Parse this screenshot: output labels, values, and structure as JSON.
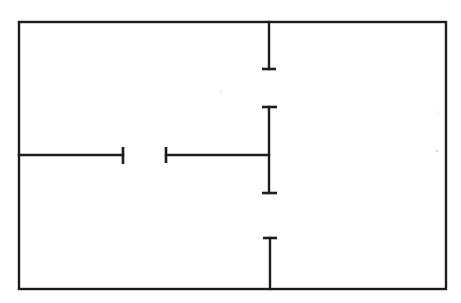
{
  "diagram": {
    "type": "floor-plan",
    "colors": {
      "background": "#ffffff",
      "line": "#1c1c1c"
    },
    "outer_wall": {
      "x1": 19,
      "y1": 22,
      "x2": 446,
      "y2": 289
    },
    "walls": [
      {
        "id": "top-stub",
        "x1": 269,
        "y1": 22,
        "x2": 269,
        "y2": 69
      },
      {
        "id": "middle-vertical",
        "x1": 269,
        "y1": 107,
        "x2": 269,
        "y2": 193
      },
      {
        "id": "bottom-stub",
        "x1": 270,
        "y1": 238,
        "x2": 270,
        "y2": 289
      },
      {
        "id": "left-horizontal",
        "x1": 19,
        "y1": 155,
        "x2": 123,
        "y2": 155
      },
      {
        "id": "center-horizontal",
        "x1": 166,
        "y1": 155,
        "x2": 269,
        "y2": 155
      }
    ],
    "caps": [
      {
        "id": "top-stub-cap",
        "x1": 262,
        "y1": 69,
        "x2": 276,
        "y2": 69
      },
      {
        "id": "middle-top-cap",
        "x1": 262,
        "y1": 107,
        "x2": 277,
        "y2": 107
      },
      {
        "id": "middle-bottom-cap",
        "x1": 262,
        "y1": 193,
        "x2": 277,
        "y2": 193
      },
      {
        "id": "bottom-stub-cap",
        "x1": 263,
        "y1": 238,
        "x2": 277,
        "y2": 238
      },
      {
        "id": "left-horizontal-cap",
        "x1": 123,
        "y1": 147,
        "x2": 123,
        "y2": 164
      },
      {
        "id": "center-horizontal-cap",
        "x1": 166,
        "y1": 147,
        "x2": 166,
        "y2": 163
      }
    ],
    "door_openings": [
      {
        "id": "door-upper-right",
        "between": [
          "top-stub-cap",
          "middle-top-cap"
        ],
        "axis": "vertical",
        "x": 269,
        "from": 69,
        "to": 107
      },
      {
        "id": "door-lower-right",
        "between": [
          "middle-bottom-cap",
          "bottom-stub-cap"
        ],
        "axis": "vertical",
        "x": 270,
        "from": 193,
        "to": 238
      },
      {
        "id": "door-center-left",
        "between": [
          "left-horizontal-cap",
          "center-horizontal-cap"
        ],
        "axis": "horizontal",
        "y": 155,
        "from": 123,
        "to": 166
      }
    ],
    "rooms": [
      {
        "id": "room-top-left",
        "label": ""
      },
      {
        "id": "room-bottom-left",
        "label": ""
      },
      {
        "id": "room-right",
        "label": ""
      }
    ]
  }
}
